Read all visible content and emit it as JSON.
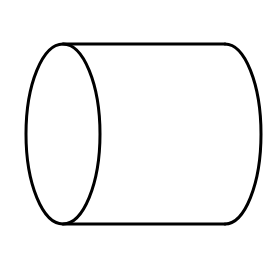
{
  "figure": {
    "type": "cylinder",
    "orientation": "horizontal",
    "stroke_color": "#000000",
    "background_color": "#ffffff",
    "front_face": {
      "shape": "ellipse",
      "cx": 63,
      "cy": 134,
      "rx": 37,
      "ry": 90
    },
    "top_edge": {
      "x1": 63,
      "y1": 44,
      "x2": 225,
      "y2": 44
    },
    "bottom_edge": {
      "x1": 63,
      "y1": 224,
      "x2": 225,
      "y2": 224
    },
    "back_arc": {
      "top_x": 225,
      "bottom_x": 225,
      "max_x": 261,
      "top_y": 44,
      "bottom_y": 224
    }
  }
}
